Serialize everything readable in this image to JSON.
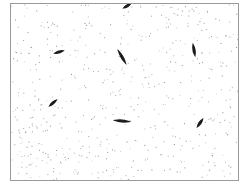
{
  "image": {
    "description": "Grayscale micrograph-style image of elongated dark organisms scattered on a speckled white background within a thin gray border",
    "colors": {
      "background": "#ffffff",
      "border": "#9a9a9a",
      "organism": "#1a1a1a",
      "speckle": "#7a7a7a"
    },
    "organisms": [
      {
        "x": 126,
        "y": 5,
        "rot": -30,
        "len": 8
      },
      {
        "x": 58,
        "y": 51,
        "rot": -15,
        "len": 9
      },
      {
        "x": 121,
        "y": 56,
        "rot": 60,
        "len": 14
      },
      {
        "x": 193,
        "y": 49,
        "rot": 80,
        "len": 11
      },
      {
        "x": 52,
        "y": 102,
        "rot": -40,
        "len": 9
      },
      {
        "x": 121,
        "y": 120,
        "rot": 5,
        "len": 14
      },
      {
        "x": 199,
        "y": 122,
        "rot": -55,
        "len": 9
      }
    ]
  }
}
